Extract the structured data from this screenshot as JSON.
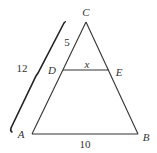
{
  "diagram": {
    "type": "similar-triangles",
    "points": {
      "A": {
        "label": "A",
        "x": 32,
        "y": 134
      },
      "B": {
        "label": "B",
        "x": 138,
        "y": 134
      },
      "C": {
        "label": "C",
        "x": 86,
        "y": 22
      },
      "D": {
        "label": "D",
        "x": 63,
        "y": 70
      },
      "E": {
        "label": "E",
        "x": 109,
        "y": 70
      }
    },
    "segments": [
      {
        "from": "A",
        "to": "B",
        "label": "10"
      },
      {
        "from": "A",
        "to": "C"
      },
      {
        "from": "B",
        "to": "C"
      },
      {
        "from": "D",
        "to": "E",
        "label": "x"
      }
    ],
    "measurements": {
      "CD": "5",
      "CA": "12",
      "DE": "x",
      "AB": "10"
    },
    "colors": {
      "line": "#333333",
      "brace": "#222222",
      "text": "#333333"
    }
  }
}
